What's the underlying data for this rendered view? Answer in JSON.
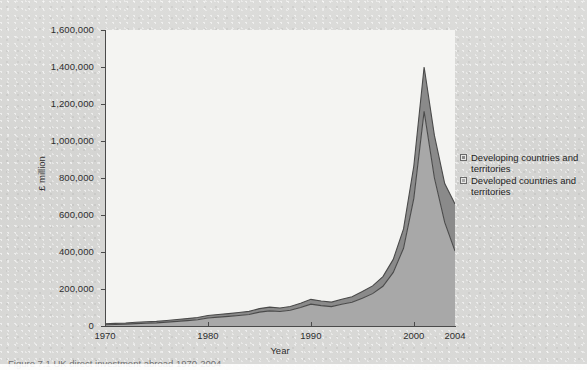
{
  "figure": {
    "caption": "Figure 7.1  UK direct investment abroad 1970-2004"
  },
  "legend": {
    "position": "right",
    "items": [
      {
        "label": "Developing countries and territories",
        "color": "#8a8a8a"
      },
      {
        "label": "Developed countries and territories",
        "color": "#a8a8a8"
      }
    ]
  },
  "chart_data": {
    "type": "area",
    "stacked": true,
    "title": "",
    "xlabel": "Year",
    "ylabel": "£ million",
    "ylim": [
      0,
      1600000
    ],
    "xlim": [
      1970,
      2004
    ],
    "grid": false,
    "ytick_labels": [
      "1,600,000",
      "1,400,000",
      "1,200,000",
      "1,000,000",
      "800,000",
      "600,000",
      "400,000",
      "200,000",
      "0"
    ],
    "ytick_values": [
      1600000,
      1400000,
      1200000,
      1000000,
      800000,
      600000,
      400000,
      200000,
      0
    ],
    "xtick_labels": [
      "1970",
      "1980",
      "1990",
      "2000",
      "2004"
    ],
    "xtick_values": [
      1970,
      1980,
      1990,
      2000,
      2004
    ],
    "x": [
      1970,
      1971,
      1972,
      1973,
      1974,
      1975,
      1976,
      1977,
      1978,
      1979,
      1980,
      1981,
      1982,
      1983,
      1984,
      1985,
      1986,
      1987,
      1988,
      1989,
      1990,
      1991,
      1992,
      1993,
      1994,
      1995,
      1996,
      1997,
      1998,
      1999,
      2000,
      2001,
      2002,
      2003,
      2004
    ],
    "series": [
      {
        "name": "Developed countries and territories",
        "color": "#a8a8a8",
        "values": [
          7000,
          8000,
          10000,
          13000,
          15000,
          17000,
          21000,
          25000,
          29000,
          34000,
          43000,
          48000,
          52000,
          57000,
          62000,
          75000,
          82000,
          78000,
          85000,
          100000,
          118000,
          110000,
          105000,
          118000,
          128000,
          150000,
          175000,
          215000,
          290000,
          420000,
          690000,
          1160000,
          800000,
          560000,
          405000
        ]
      },
      {
        "name": "Developing countries and territories",
        "color": "#8a8a8a",
        "values": [
          5000,
          6000,
          6000,
          7000,
          8000,
          8000,
          9000,
          10000,
          11000,
          12000,
          14000,
          14000,
          15000,
          16000,
          17000,
          19000,
          20000,
          19000,
          20000,
          23000,
          26000,
          25000,
          24000,
          27000,
          30000,
          36000,
          42000,
          52000,
          70000,
          105000,
          175000,
          240000,
          230000,
          210000,
          255000
        ]
      }
    ],
    "totals": [
      12000,
      14000,
      16000,
      20000,
      23000,
      25000,
      30000,
      35000,
      40000,
      46000,
      57000,
      62000,
      67000,
      73000,
      79000,
      94000,
      102000,
      97000,
      105000,
      123000,
      144000,
      135000,
      129000,
      145000,
      158000,
      186000,
      217000,
      267000,
      360000,
      525000,
      865000,
      1400000,
      1030000,
      770000,
      660000
    ],
    "annotations": {
      "peak_year": 2001,
      "peak_total": 1400000,
      "end_year": 2004,
      "end_total": 660000
    }
  }
}
